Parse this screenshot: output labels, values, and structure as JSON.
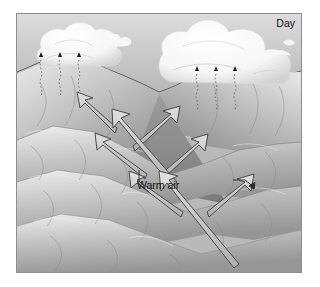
{
  "figure": {
    "kind": "scientific-illustration",
    "palette": {
      "frame_border": "#8e8e8e",
      "sky_top": "#d8d8d8",
      "sky_bottom": "#a8a8a8",
      "cloud": "#fdfdfd",
      "cloud_shadow": "#c9c9c9",
      "terrain_light": "#e8e8e8",
      "terrain_mid": "#b5b5b5",
      "terrain_dark": "#7e7e7e",
      "arrow_fill": "#cfcfcf",
      "arrow_stroke": "#4a4a4a",
      "label_text": "#111111",
      "precip_marker": "#1a1a1a",
      "background": "#ffffff"
    }
  },
  "labels": {
    "day": "Day",
    "warm_air": "Warm air"
  },
  "elements": {
    "sky_name": "sky-gradient",
    "left_cloud_name": "cloud-left",
    "right_cloud_name": "cloud-right",
    "wisp_name": "cloud-wisp-small",
    "ridge_name": "ridge-skyline",
    "terrain_name": "terrain-mountains",
    "precip_left_name": "precipitation-group-left",
    "precip_right_name": "precipitation-group-right",
    "arrows_name": "airflow-arrows"
  },
  "precipitation": {
    "marker_glyph": "triangle-up",
    "left_markers_x": [
      38,
      57,
      76
    ],
    "left_marker_y": 59,
    "right_markers_x": [
      196,
      215,
      234
    ],
    "right_marker_y": 71,
    "trail_style": "dotted-wavy-vertical"
  },
  "arrows": [
    {
      "name": "arrow-upslope-upper-left",
      "dir": "up-left",
      "x1": 120,
      "y1": 130,
      "x2": 78,
      "y2": 100
    },
    {
      "name": "arrow-upslope-mid-left",
      "dir": "up-left",
      "x1": 152,
      "y1": 178,
      "x2": 96,
      "y2": 139
    },
    {
      "name": "arrow-upslope-lower-left",
      "dir": "up-left",
      "x1": 188,
      "y1": 216,
      "x2": 128,
      "y2": 177
    },
    {
      "name": "arrow-upslope-upper-right",
      "dir": "up-right",
      "x1": 131,
      "y1": 148,
      "x2": 176,
      "y2": 114
    },
    {
      "name": "arrow-upslope-mid-right",
      "dir": "up-right",
      "x1": 160,
      "y1": 176,
      "x2": 204,
      "y2": 144
    },
    {
      "name": "arrow-upslope-lower-right",
      "dir": "up-right",
      "x1": 210,
      "y1": 214,
      "x2": 253,
      "y2": 184
    },
    {
      "name": "arrow-valley-wind-long",
      "dir": "up-left",
      "x1": 172,
      "y1": 183,
      "x2": 113,
      "y2": 114
    },
    {
      "name": "arrow-valley-wind-main",
      "dir": "up-left",
      "x1": 237,
      "y1": 263,
      "x2": 163,
      "y2": 172
    }
  ]
}
